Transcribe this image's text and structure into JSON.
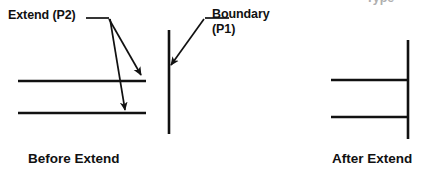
{
  "figure": {
    "title_fragment_clipped": "Type",
    "annotations": {
      "extend_label": "Extend (P2)",
      "boundary_label_line1": "Boundary",
      "boundary_label_line2": "(P1)"
    },
    "captions": {
      "before": "Before Extend",
      "after": "After Extend"
    },
    "colors": {
      "stroke": "#111111",
      "text": "#111111",
      "background": "#ffffff",
      "clipped_text": "#6e6e6e"
    },
    "geometry": {
      "line_width": 2.6,
      "before_panel": {
        "upper_line": {
          "x1": 18,
          "y1": 81,
          "x2": 146,
          "y2": 81
        },
        "lower_line": {
          "x1": 18,
          "y1": 113,
          "x2": 146,
          "y2": 113
        },
        "boundary_line": {
          "x1": 169,
          "y1": 30,
          "x2": 169,
          "y2": 134
        }
      },
      "after_panel": {
        "upper_line": {
          "x1": 331,
          "y1": 80,
          "x2": 408,
          "y2": 80
        },
        "lower_line": {
          "x1": 331,
          "y1": 117,
          "x2": 408,
          "y2": 117
        },
        "boundary_line": {
          "x1": 408,
          "y1": 40,
          "x2": 408,
          "y2": 139
        }
      },
      "leaders": {
        "extend_leader_horizontal": {
          "x1": 86,
          "y1": 18,
          "x2": 109,
          "y2": 18
        },
        "extend_arrow_1": {
          "x1": 109,
          "y1": 19,
          "x2": 141,
          "y2": 75
        },
        "extend_arrow_2": {
          "x1": 110,
          "y1": 19,
          "x2": 125,
          "y2": 111
        },
        "boundary_leader_horizontal": {
          "x1": 205,
          "y1": 18,
          "x2": 228,
          "y2": 18
        },
        "boundary_arrow": {
          "x1": 204,
          "y1": 19,
          "x2": 170,
          "y2": 66
        }
      }
    }
  }
}
